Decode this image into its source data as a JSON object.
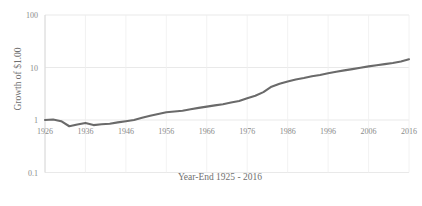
{
  "chart_data": {
    "type": "line",
    "title": "",
    "subtitle": "",
    "xlabel": "Year-End 1925 - 2016",
    "ylabel": "Growth of $1.00",
    "yscale": "log",
    "ylim": [
      0.1,
      100
    ],
    "xlim": [
      1926,
      2016
    ],
    "grid": true,
    "legend": null,
    "legend_position": "none",
    "line_color": "#6a6a6a",
    "y_ticks": [
      "100",
      "10",
      "1",
      "0.1"
    ],
    "y_tick_values": [
      100,
      10,
      1,
      0.1
    ],
    "x_ticks": [
      "1926",
      "1936",
      "1946",
      "1956",
      "1966",
      "1976",
      "1986",
      "1996",
      "2006",
      "2016"
    ],
    "x_tick_values": [
      1926,
      1936,
      1946,
      1956,
      1966,
      1976,
      1986,
      1996,
      2006,
      2016
    ],
    "series": [
      {
        "name": "Growth of $1.00",
        "x": [
          1926,
          1928,
          1930,
          1932,
          1934,
          1936,
          1938,
          1940,
          1942,
          1944,
          1946,
          1948,
          1950,
          1952,
          1954,
          1956,
          1958,
          1960,
          1962,
          1964,
          1966,
          1968,
          1970,
          1972,
          1974,
          1976,
          1978,
          1980,
          1982,
          1984,
          1986,
          1988,
          1990,
          1992,
          1994,
          1996,
          1998,
          2000,
          2002,
          2004,
          2006,
          2008,
          2010,
          2012,
          2014,
          2016
        ],
        "values": [
          1.0,
          1.02,
          0.95,
          0.76,
          0.82,
          0.88,
          0.8,
          0.83,
          0.85,
          0.9,
          0.95,
          1.0,
          1.1,
          1.2,
          1.3,
          1.4,
          1.45,
          1.5,
          1.6,
          1.7,
          1.8,
          1.9,
          2.0,
          2.15,
          2.3,
          2.6,
          2.9,
          3.4,
          4.3,
          4.9,
          5.4,
          5.9,
          6.3,
          6.8,
          7.2,
          7.8,
          8.3,
          8.8,
          9.3,
          9.9,
          10.5,
          11.0,
          11.6,
          12.2,
          13.0,
          14.3
        ]
      }
    ]
  },
  "axes": {
    "ylabel": "Growth of $1.00",
    "xlabel": "Year-End 1925 - 2016"
  }
}
